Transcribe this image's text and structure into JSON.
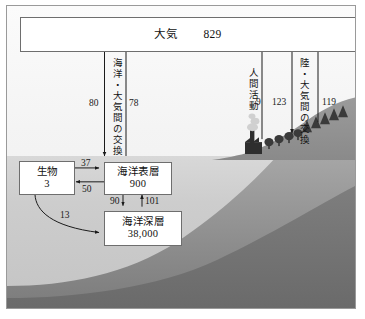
{
  "diagram": {
    "title_label": "炭素循環図",
    "atmosphere": {
      "label": "大気",
      "value": "829"
    },
    "pools": [
      {
        "name": "biota",
        "label": "生物",
        "value": "3"
      },
      {
        "name": "ocean-surface",
        "label": "海洋表層",
        "value": "900"
      },
      {
        "name": "ocean-deep",
        "label": "海洋深層",
        "value": "38,000"
      }
    ],
    "vertical_labels": [
      {
        "name": "ocean-atmosphere-exchange",
        "text": "海洋・大気間の交換"
      },
      {
        "name": "human-activity",
        "text": "人間活動"
      },
      {
        "name": "land-atmosphere-exchange",
        "text": "陸・大気間の交換"
      }
    ],
    "flows": [
      {
        "name": "atmos-to-ocean",
        "value": "80",
        "direction": "down"
      },
      {
        "name": "ocean-to-atmos",
        "value": "78",
        "direction": "up"
      },
      {
        "name": "surface-to-biota",
        "value": "37",
        "direction": "right"
      },
      {
        "name": "biota-to-surface",
        "value": "50",
        "direction": "left"
      },
      {
        "name": "surface-to-deep",
        "value": "90",
        "direction": "down"
      },
      {
        "name": "deep-to-surface",
        "value": "101",
        "direction": "up"
      },
      {
        "name": "biota-to-deep",
        "value": "13",
        "direction": "curve-right"
      },
      {
        "name": "human-emission",
        "value": "9",
        "direction": "up"
      },
      {
        "name": "atmos-to-land",
        "value": "123",
        "direction": "down"
      },
      {
        "name": "land-to-atmos",
        "value": "119",
        "direction": "up"
      }
    ],
    "scenery": [
      {
        "name": "factory-icon"
      },
      {
        "name": "smoke-plume-icon"
      },
      {
        "name": "deciduous-tree-icon"
      },
      {
        "name": "conifer-tree-icon"
      },
      {
        "name": "hillside"
      },
      {
        "name": "seafloor"
      }
    ],
    "colors": {
      "frame": "#9a9a9a",
      "box_border": "#6e6e6e",
      "arrow": "#1a1a1a",
      "sea_light": "#cdcdcd",
      "sea_deep": "#7d7d7d",
      "land": "#8d8d8d"
    }
  }
}
